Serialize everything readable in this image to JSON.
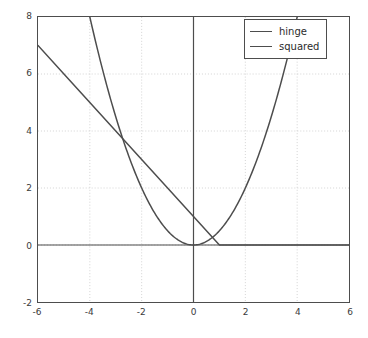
{
  "chart_data": {
    "type": "line",
    "title": "",
    "xlabel": "",
    "ylabel": "",
    "xlim": [
      -6,
      6
    ],
    "ylim": [
      -2,
      8
    ],
    "grid": true,
    "grid_style": "dotted",
    "legend_position": "upper right",
    "xticks": [
      "-6",
      "-4",
      "-2",
      "0",
      "2",
      "4",
      "6"
    ],
    "xtick_values": [
      -6,
      -4,
      -2,
      0,
      2,
      4,
      6
    ],
    "yticks": [
      "-2",
      "0",
      "2",
      "4",
      "6",
      "8"
    ],
    "ytick_values": [
      -2,
      0,
      2,
      4,
      6,
      8
    ],
    "series": [
      {
        "name": "hinge",
        "color": "#4d4d4d",
        "formula": "max(0, 1 - x)",
        "x": [
          -6,
          -5,
          -4,
          -3,
          -2,
          -1,
          0,
          1,
          2,
          3,
          4,
          5,
          6
        ],
        "values": [
          7,
          6,
          5,
          4,
          3,
          2,
          1,
          0,
          0,
          0,
          0,
          0,
          0
        ]
      },
      {
        "name": "squared",
        "color": "#4d4d4d",
        "formula": "x^2 / 2",
        "x": [
          -4,
          -3.5,
          -3,
          -2.5,
          -2,
          -1.5,
          -1,
          -0.5,
          0,
          0.5,
          1,
          1.5,
          2,
          2.5,
          3,
          3.5,
          4
        ],
        "values": [
          8,
          6.125,
          4.5,
          3.125,
          2,
          1.125,
          0.5,
          0.125,
          0,
          0.125,
          0.5,
          1.125,
          2,
          3.125,
          4.5,
          6.125,
          8
        ]
      }
    ],
    "annotations": [
      {
        "label": "curve intersection",
        "x": -2.73,
        "y": 3.73
      },
      {
        "label": "hinge kink",
        "x": 1,
        "y": 0
      },
      {
        "label": "squared minimum",
        "x": 0,
        "y": 0
      }
    ]
  },
  "legend": {
    "entries": [
      {
        "label": "hinge"
      },
      {
        "label": "squared"
      }
    ]
  },
  "axes": {
    "zero_line_color": "#4d4d4d",
    "spine_color": "#4d4d4d",
    "grid_color": "#cfcfcf",
    "background": "#ffffff"
  }
}
